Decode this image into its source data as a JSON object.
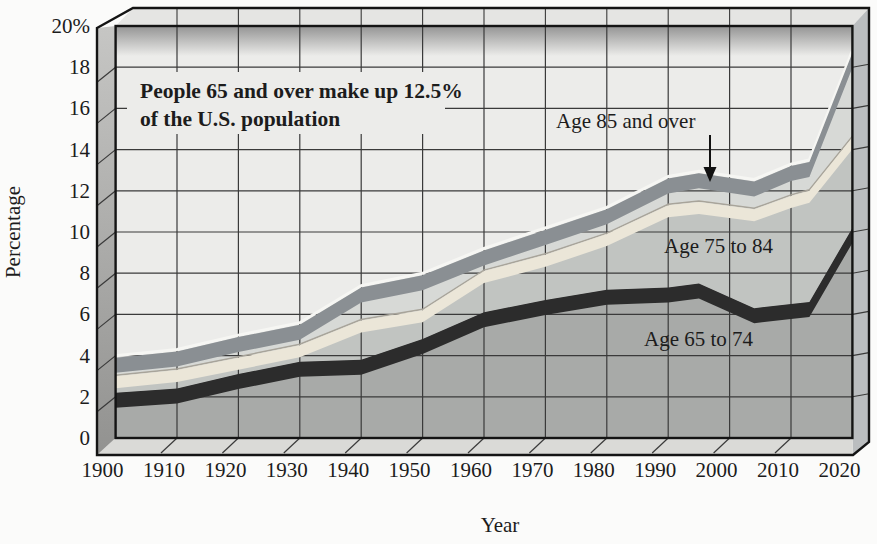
{
  "figure": {
    "annotation": {
      "line1": "People 65 and over make up 12.5%",
      "line2": "of the U.S. population"
    },
    "band_labels": {
      "band3": "Age 85 and over",
      "band2": "Age 75 to 84",
      "band1": "Age 65 to 74"
    },
    "y_axis": {
      "title": "Percentage",
      "ticks": [
        "20%",
        "18",
        "16",
        "14",
        "12",
        "10",
        "8",
        "6",
        "4",
        "2",
        "0"
      ]
    },
    "x_axis": {
      "title": "Year",
      "ticks": [
        "1900",
        "1910",
        "1920",
        "1930",
        "1940",
        "1950",
        "1960",
        "1970",
        "1980",
        "1990",
        "2000",
        "2010",
        "2020"
      ]
    }
  },
  "chart_data": {
    "type": "area",
    "stacked": true,
    "xlabel": "Year",
    "ylabel": "Percentage",
    "ylim": [
      0,
      20
    ],
    "xlim": [
      1900,
      2020
    ],
    "grid": true,
    "legend_position": "inline-labels",
    "categories": [
      1900,
      1910,
      1920,
      1930,
      1940,
      1950,
      1960,
      1970,
      1980,
      1990,
      2000,
      2010,
      2020
    ],
    "series": [
      {
        "name": "Age 65 to 74",
        "values": [
          2.2,
          2.4,
          3.1,
          3.7,
          3.8,
          4.8,
          6.1,
          6.7,
          7.2,
          7.3,
          6.6,
          6.5,
          10.2
        ]
      },
      {
        "name": "Age 75 to 84",
        "values": [
          0.8,
          0.9,
          0.8,
          0.8,
          1.9,
          1.4,
          2.0,
          2.2,
          2.7,
          4.0,
          4.6,
          5.3,
          4.4
        ]
      },
      {
        "name": "Age 85 and over",
        "values": [
          0.9,
          0.9,
          1.0,
          1.0,
          1.6,
          1.7,
          1.0,
          1.2,
          1.2,
          1.3,
          1.3,
          1.4,
          4.1
        ]
      }
    ],
    "cumulative_totals_65_plus": [
      3.9,
      4.2,
      4.9,
      5.5,
      7.3,
      7.9,
      9.1,
      10.1,
      11.1,
      12.6,
      12.5,
      13.2,
      18.7
    ],
    "render_path": {
      "x": [
        1900,
        1910,
        1920,
        1930,
        1940,
        1950,
        1960,
        1970,
        1980,
        1990,
        1995,
        2004,
        2010,
        2013,
        2020
      ],
      "c1": [
        2.2,
        2.4,
        3.1,
        3.7,
        3.8,
        4.8,
        6.1,
        6.7,
        7.2,
        7.3,
        7.5,
        6.3,
        6.5,
        6.6,
        10.2
      ],
      "c2": [
        3.0,
        3.3,
        3.9,
        4.5,
        5.7,
        6.2,
        8.1,
        8.9,
        9.9,
        11.3,
        11.45,
        11.1,
        11.75,
        12.0,
        14.6
      ],
      "c3": [
        3.9,
        4.2,
        4.9,
        5.5,
        7.3,
        7.9,
        9.1,
        10.1,
        11.1,
        12.6,
        12.85,
        12.45,
        13.2,
        13.4,
        18.7
      ]
    }
  },
  "colors": {
    "page_bg": "#fbfbfa",
    "plot_bg": "#ececea",
    "top_shade": "#8f8f8f",
    "band1_fill": "#a8aaa8",
    "band2_fill": "#c1c4c1",
    "band3_fill": "#d7d9d6",
    "ribbon_65_74": "#2c2c2c",
    "ribbon_75_84": "#ebe6d8",
    "ribbon_85_over": "#8a8f93",
    "ribbon_highlight": "#f6f6f3",
    "grid": "#3a3a3a",
    "frame": "#141414",
    "left_wall_top": "#c6c6c4",
    "left_wall_bottom": "#929290",
    "floor": "#dadad7",
    "right_wall": "#babdbf",
    "top_face": "#e5e5e3",
    "text": "#1c1c1c"
  }
}
